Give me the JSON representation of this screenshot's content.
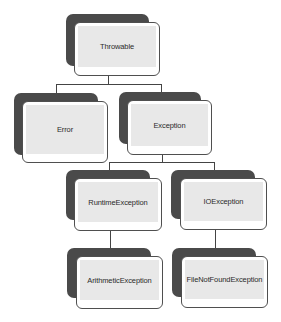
{
  "diagram": {
    "colors": {
      "shadow": "#4a4a4a",
      "card_border": "#4f4f4f",
      "card_fill": "#e8e8e8",
      "connector": "#444444",
      "text": "#2a2a2a"
    },
    "nodes": [
      {
        "id": "throwable",
        "label": "Throwable",
        "level": 0,
        "parent": null
      },
      {
        "id": "error",
        "label": "Error",
        "level": 1,
        "parent": "throwable"
      },
      {
        "id": "exception",
        "label": "Exception",
        "level": 1,
        "parent": "throwable"
      },
      {
        "id": "runtime-exception",
        "label": "RuntimeException",
        "level": 2,
        "parent": "exception"
      },
      {
        "id": "io-exception",
        "label": "IOException",
        "level": 2,
        "parent": "exception"
      },
      {
        "id": "arithmetic-exception",
        "label": "ArithmeticException",
        "level": 3,
        "parent": "runtime-exception"
      },
      {
        "id": "file-not-found-exception",
        "label": "FileNotFoundException",
        "level": 3,
        "parent": "io-exception"
      }
    ],
    "edges": [
      {
        "from": "throwable",
        "to": "error"
      },
      {
        "from": "throwable",
        "to": "exception"
      },
      {
        "from": "exception",
        "to": "runtime-exception"
      },
      {
        "from": "exception",
        "to": "io-exception"
      },
      {
        "from": "runtime-exception",
        "to": "arithmetic-exception"
      },
      {
        "from": "io-exception",
        "to": "file-not-found-exception"
      }
    ]
  }
}
